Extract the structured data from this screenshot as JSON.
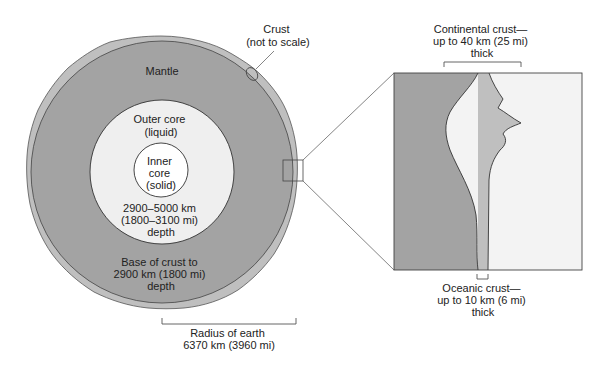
{
  "diagram": {
    "colors": {
      "mantle": "#a3a3a3",
      "crust": "#bfbfbf",
      "outer_core": "#efefef",
      "inner_core": "#ffffff",
      "ocean_side": "#f3f3f3",
      "stroke": "#333333",
      "leader": "#666666"
    },
    "labels": {
      "mantle": "Mantle",
      "crust": {
        "line1": "Crust",
        "line2": "(not to scale)"
      },
      "outer_core": {
        "line1": "Outer core",
        "line2": "(liquid)"
      },
      "inner_core": {
        "line1": "Inner",
        "line2": "core",
        "line3": "(solid)"
      },
      "core_depth": {
        "line1": "2900–5000 km",
        "line2": "(1800–3100 mi)",
        "line3": "depth"
      },
      "mantle_depth": {
        "line1": "Base of crust to",
        "line2": "2900 km (1800 mi)",
        "line3": "depth"
      },
      "radius": {
        "line1": "Radius of earth",
        "line2": "6370 km (3960 mi)"
      },
      "continental_crust": {
        "line1": "Continental crust—",
        "line2": "up to 40 km (25 mi)",
        "line3": "thick"
      },
      "oceanic_crust": {
        "line1": "Oceanic crust—",
        "line2": "up to 10 km (6 mi)",
        "line3": "thick"
      }
    }
  }
}
